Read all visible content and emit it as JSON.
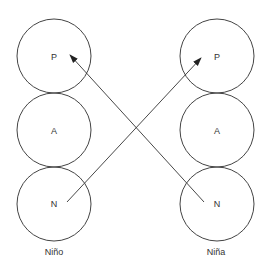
{
  "diagram": {
    "columns": [
      {
        "id": "nino",
        "label": "Niño",
        "nodes": [
          {
            "id": "nino-P",
            "label": "P"
          },
          {
            "id": "nino-A",
            "label": "A"
          },
          {
            "id": "nino-N",
            "label": "N"
          }
        ]
      },
      {
        "id": "nina",
        "label": "Niña",
        "nodes": [
          {
            "id": "nina-P",
            "label": "P"
          },
          {
            "id": "nina-A",
            "label": "A"
          },
          {
            "id": "nina-N",
            "label": "N"
          }
        ]
      }
    ],
    "edges": [
      {
        "from": "nino-N",
        "to": "nina-P",
        "directed": true
      },
      {
        "from": "nina-N",
        "to": "nino-P",
        "directed": true
      }
    ],
    "colors": {
      "stroke": "#444444",
      "text": "#333333",
      "background": "#ffffff"
    }
  }
}
